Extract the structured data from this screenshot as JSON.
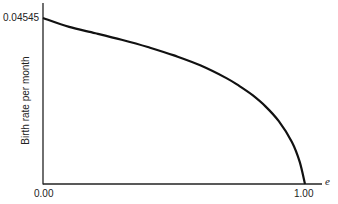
{
  "chart_data": {
    "type": "line",
    "title": "",
    "xlabel": "e",
    "ylabel": "Birth rate per month",
    "xlim": [
      0,
      1.0
    ],
    "ylim": [
      0,
      0.04545
    ],
    "grid": false,
    "legend": null,
    "x_tick_labels": [
      "0.00",
      "1.00"
    ],
    "y_tick_labels": [
      "0.04545"
    ],
    "series": [
      {
        "name": "Birth rate",
        "x": [
          0.0,
          0.1,
          0.2,
          0.3,
          0.4,
          0.5,
          0.6,
          0.7,
          0.75,
          0.8,
          0.85,
          0.9,
          0.95,
          0.98,
          1.0
        ],
        "y": [
          0.04545,
          0.043,
          0.0413,
          0.0395,
          0.0375,
          0.0352,
          0.0325,
          0.029,
          0.0268,
          0.0243,
          0.0212,
          0.0172,
          0.0115,
          0.006,
          0.0
        ]
      }
    ],
    "colors": {
      "line": "#111111",
      "axis": "#222222",
      "text": "#222222"
    }
  },
  "labels": {
    "y_top": "0.04545",
    "x_origin": "0.00",
    "x_end": "1.00",
    "x_var": "e",
    "y_axis": "Birth rate per month"
  }
}
